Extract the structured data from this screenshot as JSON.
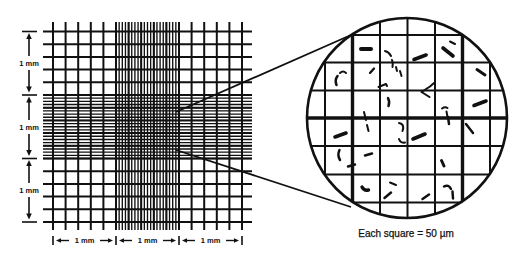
{
  "figure": {
    "left_scale": {
      "labels": [
        "1 mm",
        "1 mm",
        "1 mm"
      ]
    },
    "bottom_scale": {
      "labels": [
        "1 mm",
        "1 mm",
        "1 mm"
      ]
    },
    "magnified_view": {
      "caption": "Each square = 50 µm"
    }
  },
  "colors": {
    "ink": "#111111",
    "background": "#ffffff"
  }
}
